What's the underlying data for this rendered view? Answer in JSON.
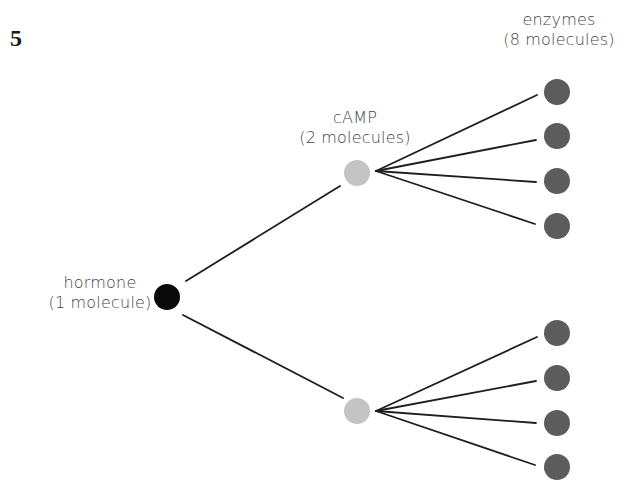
{
  "figure": {
    "number": "5"
  },
  "labels": {
    "hormone": {
      "name": "hormone",
      "count": "(1 molecule)"
    },
    "camp": {
      "name": "cAMP",
      "count": "(2 molecules)"
    },
    "enzymes": {
      "name": "enzymes",
      "count": "(8 molecules)"
    }
  },
  "colors": {
    "hormone": "#0a0a0a",
    "camp": "#c4c4c4",
    "enzyme": "#5c5c5c",
    "line": "#1e1e1e",
    "text": "#444444"
  },
  "nodes": {
    "hormone": {
      "cx": 167,
      "cy": 297,
      "r": 13
    },
    "camp": [
      {
        "cx": 357,
        "cy": 173,
        "r": 13
      },
      {
        "cx": 357,
        "cy": 411,
        "r": 13
      }
    ],
    "enzymes": [
      {
        "cx": 557,
        "cy": 92,
        "r": 13
      },
      {
        "cx": 557,
        "cy": 136,
        "r": 13
      },
      {
        "cx": 557,
        "cy": 181,
        "r": 13
      },
      {
        "cx": 557,
        "cy": 226,
        "r": 13
      },
      {
        "cx": 557,
        "cy": 333,
        "r": 13
      },
      {
        "cx": 557,
        "cy": 378,
        "r": 13
      },
      {
        "cx": 557,
        "cy": 423,
        "r": 13
      },
      {
        "cx": 557,
        "cy": 467,
        "r": 13
      }
    ]
  },
  "edges": [
    {
      "x1": 186,
      "y1": 281,
      "x2": 340,
      "y2": 186
    },
    {
      "x1": 183,
      "y1": 315,
      "x2": 343,
      "y2": 398
    },
    {
      "x1": 376,
      "y1": 171,
      "x2": 537,
      "y2": 95
    },
    {
      "x1": 376,
      "y1": 171,
      "x2": 536,
      "y2": 140
    },
    {
      "x1": 376,
      "y1": 171,
      "x2": 536,
      "y2": 182
    },
    {
      "x1": 376,
      "y1": 171,
      "x2": 535,
      "y2": 224
    },
    {
      "x1": 376,
      "y1": 411,
      "x2": 537,
      "y2": 337
    },
    {
      "x1": 376,
      "y1": 411,
      "x2": 536,
      "y2": 381
    },
    {
      "x1": 376,
      "y1": 411,
      "x2": 536,
      "y2": 423
    },
    {
      "x1": 376,
      "y1": 411,
      "x2": 535,
      "y2": 465
    }
  ]
}
